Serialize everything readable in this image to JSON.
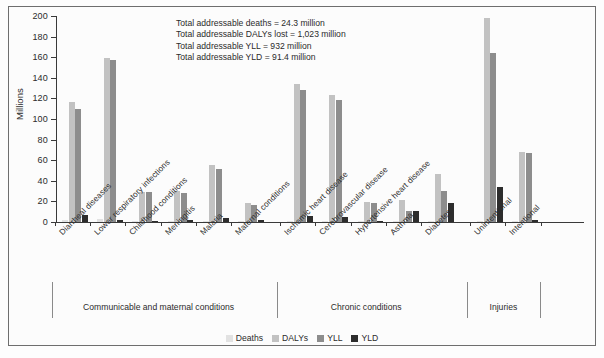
{
  "chart_data": {
    "type": "bar",
    "title": "",
    "xlabel": "",
    "ylabel": "Millions",
    "ylim": [
      0,
      200
    ],
    "yticks": [
      0,
      20,
      40,
      60,
      80,
      100,
      120,
      140,
      160,
      180,
      200
    ],
    "grid": false,
    "legend_position": "bottom",
    "categories": [
      "Diarrheal diseases",
      "Lower respiratory infections",
      "Childhood conditions",
      "Meningitis",
      "Malaria",
      "Maternal conditions",
      "Ischemic heart disease",
      "Cerebrovascular disease",
      "Hypertensive heart disease",
      "Asthma",
      "Diabetes",
      "Unintentional",
      "Intentional"
    ],
    "series": [
      {
        "name": "Deaths",
        "color": "#e2e2e2",
        "values": [
          2.2,
          3.1,
          0.9,
          0.7,
          1.3,
          0.5,
          1.3,
          0.9,
          0.6,
          0.3,
          1.1,
          1.1,
          0.6
        ]
      },
      {
        "name": "DALYs",
        "color": "#c2c2c2",
        "values": [
          117,
          159,
          29,
          30,
          55,
          18.5,
          134,
          123,
          19,
          21,
          47,
          198,
          68
        ]
      },
      {
        "name": "YLL",
        "color": "#8d8d8d",
        "values": [
          110,
          157,
          29,
          28,
          51,
          17,
          128,
          118,
          18,
          11,
          30,
          164,
          67
        ]
      },
      {
        "name": "YLD",
        "color": "#2d2d2d",
        "values": [
          7,
          2,
          0.7,
          2,
          4,
          1.8,
          6,
          5,
          1,
          11,
          18,
          34,
          1.5
        ]
      }
    ],
    "groups": [
      {
        "label": "Communicable and maternal conditions",
        "start": 0,
        "end": 5
      },
      {
        "label": "Chronic conditions",
        "start": 6,
        "end": 10
      },
      {
        "label": "Injuries",
        "start": 11,
        "end": 12
      }
    ],
    "annotations": [
      "Total addressable deaths = 24.3 million",
      "Total addressable DALYs lost = 1,023 million",
      "Total addressable YLL = 932 million",
      "Total addressable YLD = 91.4 million"
    ]
  }
}
